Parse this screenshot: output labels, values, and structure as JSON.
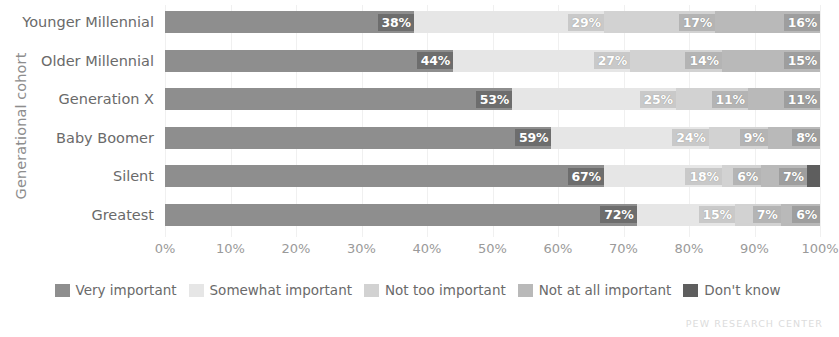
{
  "chart_data": {
    "type": "bar",
    "variant": "stacked-horizontal-100",
    "title": "",
    "xlabel": "",
    "ylabel": "Generational cohort",
    "xlim": [
      0,
      100
    ],
    "grid": true,
    "legend_position": "bottom",
    "categories": [
      "Younger Millennial",
      "Older Millennial",
      "Generation X",
      "Baby Boomer",
      "Silent",
      "Greatest"
    ],
    "xticks": [
      "0%",
      "10%",
      "20%",
      "30%",
      "40%",
      "50%",
      "60%",
      "70%",
      "80%",
      "90%",
      "100%"
    ],
    "xtick_values": [
      0,
      10,
      20,
      30,
      40,
      50,
      60,
      70,
      80,
      90,
      100
    ],
    "series": [
      {
        "name": "Very important",
        "color": "#8e8e8e",
        "label_color": "#6d6d6d",
        "values": [
          38,
          44,
          53,
          59,
          67,
          72
        ],
        "labels": [
          "38%",
          "44%",
          "53%",
          "59%",
          "67%",
          "72%"
        ]
      },
      {
        "name": "Somewhat important",
        "color": "#e6e6e6",
        "label_color": "#c9c9c9",
        "values": [
          29,
          27,
          25,
          24,
          18,
          15
        ],
        "labels": [
          "29%",
          "27%",
          "25%",
          "24%",
          "18%",
          "15%"
        ]
      },
      {
        "name": "Not too important",
        "color": "#d2d2d2",
        "label_color": "#b4b4b4",
        "values": [
          17,
          14,
          11,
          9,
          6,
          7
        ],
        "labels": [
          "17%",
          "14%",
          "11%",
          "9%",
          "6%",
          "7%"
        ]
      },
      {
        "name": "Not at all important",
        "color": "#b9b9b9",
        "label_color": "#9e9e9e",
        "values": [
          16,
          15,
          11,
          8,
          7,
          6
        ],
        "labels": [
          "16%",
          "15%",
          "11%",
          "8%",
          "7%",
          "6%"
        ]
      },
      {
        "name": "Don't know",
        "color": "#5e5e5e",
        "label_color": "#5e5e5e",
        "values": [
          0,
          0,
          0,
          0,
          2,
          0
        ],
        "labels": [
          "",
          "",
          "",
          "",
          "",
          ""
        ]
      }
    ]
  },
  "footer": {
    "source": "PEW RESEARCH CENTER"
  }
}
